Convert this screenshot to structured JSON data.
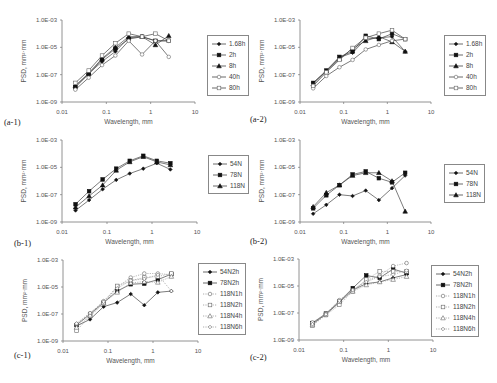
{
  "figure": {
    "common": {
      "xlabel": "Wavelength, mm",
      "ylabel": "PSD, mm²·mm",
      "x_ticks": [
        "0.01",
        "0.1",
        "1",
        "10"
      ],
      "y_ticks": [
        "1.0E-03",
        "1.0E-05",
        "1.0E-07",
        "1.0E-09"
      ]
    }
  },
  "chart_data": [
    {
      "id": "a-1",
      "label": "(a-1)",
      "type": "line",
      "xlabel": "Wavelength, mm",
      "ylabel": "PSD, mm²·mm",
      "xscale": "log",
      "yscale": "log",
      "xlim": [
        0.01,
        10
      ],
      "ylim": [
        1e-09,
        0.001
      ],
      "x": [
        0.02,
        0.04,
        0.08,
        0.16,
        0.32,
        0.64,
        1.28,
        2.56
      ],
      "legend_position": "right",
      "series": [
        {
          "name": "1.68h",
          "marker": "diamond-filled",
          "dash": false,
          "values": [
            1.5e-08,
            1.2e-07,
            9e-07,
            5e-06,
            5e-05,
            6e-05,
            3e-05,
            3e-05
          ]
        },
        {
          "name": "2h",
          "marker": "square-filled",
          "dash": false,
          "values": [
            1.2e-08,
            1.1e-07,
            1.3e-06,
            8e-06,
            4e-05,
            6e-05,
            3e-05,
            3e-05
          ]
        },
        {
          "name": "8h",
          "marker": "triangle-filled",
          "dash": false,
          "values": [
            1.5e-08,
            1.3e-07,
            1.5e-06,
            1e-05,
            6e-05,
            6e-05,
            1.5e-05,
            7e-05
          ]
        },
        {
          "name": "40h",
          "marker": "circle-open",
          "dash": false,
          "values": [
            8e-09,
            6e-08,
            5e-07,
            2.5e-06,
            3e-05,
            3e-06,
            3e-05,
            2e-06
          ]
        },
        {
          "name": "80h",
          "marker": "square-open",
          "dash": false,
          "values": [
            2.5e-08,
            2e-07,
            2.5e-06,
            2e-05,
            0.0001,
            6e-05,
            0.0001,
            3e-05
          ]
        }
      ]
    },
    {
      "id": "a-2",
      "label": "(a-2)",
      "type": "line",
      "xlabel": "Wavelength, mm",
      "ylabel": "PSD, mm²·mm",
      "xscale": "log",
      "yscale": "log",
      "xlim": [
        0.01,
        10
      ],
      "ylim": [
        1e-09,
        0.001
      ],
      "x": [
        0.02,
        0.04,
        0.08,
        0.16,
        0.32,
        0.64,
        1.28,
        2.56
      ],
      "legend_position": "right",
      "series": [
        {
          "name": "1.68h",
          "marker": "diamond-filled",
          "dash": false,
          "values": [
            2.5e-08,
            1.8e-07,
            1.8e-06,
            4e-06,
            4e-05,
            5e-05,
            6e-05,
            5e-06
          ]
        },
        {
          "name": "2h",
          "marker": "square-filled",
          "dash": false,
          "values": [
            2.5e-08,
            2e-07,
            2e-06,
            5e-06,
            7e-05,
            4e-05,
            0.0001,
            4e-05
          ]
        },
        {
          "name": "8h",
          "marker": "triangle-filled",
          "dash": false,
          "values": [
            2e-08,
            1.8e-07,
            1.5e-06,
            8e-06,
            3e-05,
            6e-05,
            2.5e-05,
            5e-06
          ]
        },
        {
          "name": "40h",
          "marker": "circle-open",
          "dash": false,
          "values": [
            1e-08,
            8e-08,
            3.5e-07,
            1.2e-06,
            7e-06,
            1.5e-05,
            3e-05,
            4e-05
          ]
        },
        {
          "name": "80h",
          "marker": "square-open",
          "dash": false,
          "values": [
            1.5e-08,
            1.5e-07,
            1.2e-06,
            9e-06,
            5e-05,
            0.0001,
            0.00018,
            4e-05
          ]
        }
      ]
    },
    {
      "id": "b-1",
      "label": "(b-1)",
      "type": "line",
      "xlabel": "Wavelength, mm",
      "ylabel": "PSD, mm²·mm",
      "xscale": "log",
      "yscale": "log",
      "xlim": [
        0.01,
        10
      ],
      "ylim": [
        1e-09,
        0.001
      ],
      "x": [
        0.02,
        0.04,
        0.08,
        0.16,
        0.32,
        0.64,
        1.28,
        2.56
      ],
      "legend_position": "right",
      "series": [
        {
          "name": "54N",
          "marker": "diamond-filled",
          "dash": false,
          "values": [
            7e-09,
            4e-08,
            2.5e-07,
            1.2e-06,
            3.5e-06,
            8e-06,
            2e-05,
            7e-06
          ]
        },
        {
          "name": "78N",
          "marker": "square-filled",
          "dash": false,
          "values": [
            2e-08,
            1.8e-07,
            1.3e-06,
            8e-06,
            3e-05,
            7e-05,
            3e-05,
            2e-05
          ]
        },
        {
          "name": "118N",
          "marker": "triangle-filled",
          "dash": false,
          "values": [
            1.2e-08,
            8e-08,
            5e-07,
            6e-06,
            2.5e-05,
            6e-05,
            2.5e-05,
            1.5e-05
          ]
        }
      ]
    },
    {
      "id": "b-2",
      "label": "(b-2)",
      "type": "line",
      "xlabel": "Wavelength, mm",
      "ylabel": "PSD, mm²·mm",
      "xscale": "log",
      "yscale": "log",
      "xlim": [
        0.01,
        10
      ],
      "ylim": [
        1e-09,
        0.001
      ],
      "x": [
        0.02,
        0.04,
        0.08,
        0.16,
        0.32,
        0.64,
        1.28,
        2.56
      ],
      "legend_position": "right",
      "series": [
        {
          "name": "54N",
          "marker": "diamond-filled",
          "dash": false,
          "values": [
            4e-09,
            1.8e-08,
            1e-07,
            8e-08,
            2e-07,
            4e-08,
            3e-07,
            2.5e-06
          ]
        },
        {
          "name": "78N",
          "marker": "square-filled",
          "dash": false,
          "values": [
            1e-08,
            9e-08,
            5e-07,
            3e-06,
            5e-06,
            1.6e-06,
            8e-07,
            4e-06
          ]
        },
        {
          "name": "118N",
          "marker": "triangle-filled",
          "dash": false,
          "values": [
            1.3e-08,
            1.4e-07,
            5e-07,
            2.5e-06,
            4e-06,
            4e-06,
            1e-06,
            6e-09
          ]
        }
      ]
    },
    {
      "id": "c-1",
      "label": "(c-1)",
      "type": "line",
      "xlabel": "Wavelength, mm",
      "ylabel": "PSD, mm²·mm",
      "xscale": "log",
      "yscale": "log",
      "xlim": [
        0.01,
        10
      ],
      "ylim": [
        1e-09,
        0.001
      ],
      "x": [
        0.02,
        0.04,
        0.08,
        0.16,
        0.32,
        0.64,
        1.28,
        2.56
      ],
      "legend_position": "right",
      "series": [
        {
          "name": "54N2h",
          "marker": "diamond-filled",
          "dash": false,
          "values": [
            1.3e-08,
            4e-08,
            3.5e-07,
            7e-07,
            3e-06,
            4.5e-07,
            4e-06,
            5e-06
          ]
        },
        {
          "name": "78N2h",
          "marker": "square-filled",
          "dash": false,
          "values": [
            1.5e-08,
            1e-07,
            7e-07,
            5e-06,
            1.6e-05,
            1.8e-05,
            3.5e-05,
            9e-05
          ]
        },
        {
          "name": "118N1h",
          "marker": "circle-open",
          "dash": true,
          "values": [
            1.8e-08,
            1.1e-07,
            9e-07,
            1e-05,
            5e-05,
            0.0001,
            0.0001,
            8e-05
          ]
        },
        {
          "name": "118N2h",
          "marker": "square-open",
          "dash": true,
          "values": [
            6e-09,
            7e-08,
            6e-07,
            1.2e-05,
            3e-05,
            5e-05,
            6e-05,
            0.0001
          ]
        },
        {
          "name": "118N4h",
          "marker": "triangle-open",
          "dash": true,
          "values": [
            1e-08,
            8e-08,
            7e-07,
            4e-06,
            2e-05,
            2.5e-05,
            2.2e-05,
            6e-05
          ]
        },
        {
          "name": "118N6h",
          "marker": "diamond-open",
          "dash": true,
          "values": [
            2e-08,
            1.2e-07,
            8e-07,
            8e-06,
            3e-05,
            4e-05,
            8e-05,
            5e-06
          ]
        }
      ]
    },
    {
      "id": "c-2",
      "label": "(c-2)",
      "type": "line",
      "xlabel": "Wavelength, mm",
      "ylabel": "PSD, mm²·mm",
      "xscale": "log",
      "yscale": "log",
      "xlim": [
        0.01,
        10
      ],
      "ylim": [
        1e-09,
        0.001
      ],
      "x": [
        0.02,
        0.04,
        0.08,
        0.16,
        0.32,
        0.64,
        1.28,
        2.56
      ],
      "legend_position": "right",
      "series": [
        {
          "name": "54N2h",
          "marker": "diamond-filled",
          "dash": false,
          "values": [
            1.5e-08,
            8e-08,
            6e-07,
            5e-06,
            1.5e-05,
            2e-05,
            4e-05,
            7e-05
          ]
        },
        {
          "name": "78N2h",
          "marker": "square-filled",
          "dash": false,
          "values": [
            1.8e-08,
            9e-08,
            7e-07,
            7e-06,
            6e-05,
            4e-05,
            0.00018,
            9e-05
          ]
        },
        {
          "name": "118N1h",
          "marker": "circle-open",
          "dash": true,
          "values": [
            2e-08,
            9e-08,
            9e-07,
            5e-06,
            2.5e-05,
            6e-05,
            0.0003,
            0.0005
          ]
        },
        {
          "name": "118N2h",
          "marker": "square-open",
          "dash": true,
          "values": [
            1.2e-08,
            7e-08,
            4e-07,
            4e-06,
            3e-05,
            0.00012,
            0.00012,
            0.00012
          ]
        },
        {
          "name": "118N4h",
          "marker": "triangle-open",
          "dash": true,
          "values": [
            1.3e-08,
            8e-08,
            7e-07,
            4e-06,
            1.2e-05,
            2e-05,
            3e-05,
            5e-05
          ]
        },
        {
          "name": "118N6h",
          "marker": "diamond-open",
          "dash": true,
          "values": [
            1.5e-08,
            8e-08,
            8e-07,
            5e-06,
            2e-05,
            5e-05,
            7e-05,
            0.00014
          ]
        }
      ]
    }
  ],
  "layout": {
    "panels": [
      {
        "left": 0,
        "top": 0,
        "plot": [
          62,
          20,
          195,
          102
        ],
        "legend": [
          207,
          35,
          40,
          57
        ],
        "label_pos": [
          4,
          117
        ]
      },
      {
        "left": 248,
        "top": 0,
        "plot": [
          52,
          20,
          183,
          102
        ],
        "legend": [
          196,
          35,
          48,
          57
        ],
        "label_pos": [
          2,
          114
        ]
      },
      {
        "left": 0,
        "top": 125,
        "plot": [
          62,
          15,
          197,
          97
        ],
        "legend": [
          208,
          30,
          34,
          35
        ],
        "label_pos": [
          14,
          113
        ]
      },
      {
        "left": 248,
        "top": 125,
        "plot": [
          52,
          15,
          183,
          97
        ],
        "legend": [
          196,
          39,
          36,
          34
        ],
        "label_pos": [
          2,
          111
        ]
      },
      {
        "left": 0,
        "top": 250,
        "plot": [
          63,
          10,
          198,
          91
        ],
        "legend": [
          198,
          13,
          46,
          66
        ],
        "label_pos": [
          14,
          100
        ]
      },
      {
        "left": 248,
        "top": 250,
        "plot": [
          51,
          9,
          185,
          90
        ],
        "legend": [
          183,
          15,
          48,
          66
        ],
        "label_pos": [
          2,
          102
        ]
      }
    ]
  }
}
